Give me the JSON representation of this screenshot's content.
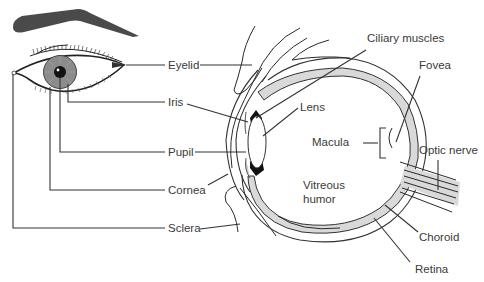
{
  "diagram": {
    "title": "",
    "front_view_labels": {
      "eyelid": "Eyelid",
      "iris": "Iris",
      "pupil": "Pupil",
      "cornea": "Cornea",
      "sclera": "Sclera"
    },
    "cross_section_labels": {
      "ciliary_muscles": "Ciliary muscles",
      "fovea": "Fovea",
      "lens": "Lens",
      "macula": "Macula",
      "optic_nerve": "Optic nerve",
      "vitreous_humor_line1": "Vitreous",
      "vitreous_humor_line2": "humor",
      "choroid": "Choroid",
      "retina": "Retina"
    },
    "colors": {
      "line": "#333333",
      "text": "#3a3a3a",
      "eyebrow": "#4a4a4a",
      "iris_fill": "#8c8c8c",
      "choroid_fill": "#d9d9d9",
      "pupil": "#111111"
    }
  }
}
